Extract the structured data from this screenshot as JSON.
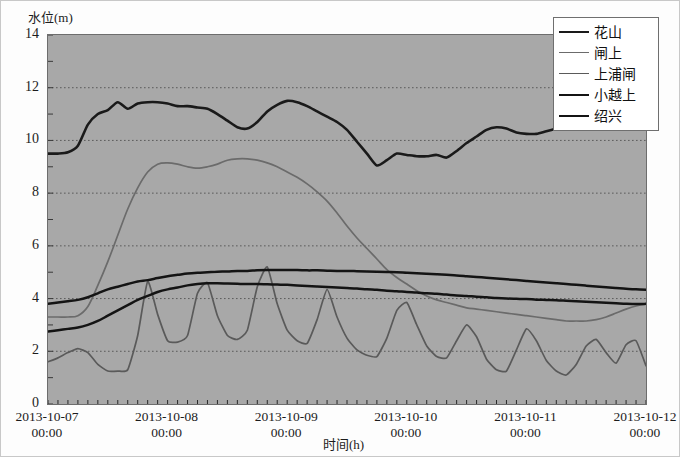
{
  "axes": {
    "y_title": "水位(m)",
    "x_title": "时间(h)",
    "y_ticks": [
      "14",
      "12",
      "10",
      "8",
      "6",
      "4",
      "2",
      "0"
    ],
    "x_ticks": [
      {
        "date": "2013-10-07",
        "time": "00:00"
      },
      {
        "date": "2013-10-08",
        "time": "00:00"
      },
      {
        "date": "2013-10-09",
        "time": "00:00"
      },
      {
        "date": "2013-10-10",
        "time": "00:00"
      },
      {
        "date": "2013-10-11",
        "time": "00:00"
      },
      {
        "date": "2013-10-12",
        "time": "00:00"
      }
    ]
  },
  "legend": {
    "items": [
      {
        "label": "花山",
        "color": "#1a1a1a",
        "width": "2.6px"
      },
      {
        "label": "闸上",
        "color": "#6b6b6b",
        "width": "1.8px"
      },
      {
        "label": "上浦闸",
        "color": "#5a5a5a",
        "width": "1.8px"
      },
      {
        "label": "小越上",
        "color": "#141414",
        "width": "2.6px"
      },
      {
        "label": "绍兴",
        "color": "#141414",
        "width": "2.6px"
      }
    ]
  },
  "style": {
    "plot_bg": "#a8a8a8",
    "grid_color": "#4e4e4e",
    "frame_color": "#6d6d6d",
    "text_color": "#1c1c1c"
  },
  "chart_data": {
    "type": "line",
    "title": "",
    "xlabel": "时间(h)",
    "ylabel": "水位(m)",
    "ylim": [
      0,
      14
    ],
    "xlim": [
      "2013-10-07 00:00",
      "2013-10-12 00:00"
    ],
    "grid": true,
    "legend_position": "top-right",
    "x_unit": "hours since 2013-10-07 00:00",
    "x": [
      0,
      2,
      4,
      6,
      8,
      10,
      12,
      14,
      16,
      18,
      20,
      22,
      24,
      26,
      28,
      30,
      32,
      34,
      36,
      38,
      40,
      42,
      44,
      46,
      48,
      50,
      52,
      54,
      56,
      58,
      60,
      62,
      64,
      66,
      68,
      70,
      72,
      74,
      76,
      78,
      80,
      82,
      84,
      86,
      88,
      90,
      92,
      94,
      96,
      98,
      100,
      102,
      104,
      106,
      108,
      110,
      112,
      114,
      116,
      118,
      120
    ],
    "series": [
      {
        "name": "花山",
        "color": "#1a1a1a",
        "values": [
          9.5,
          9.5,
          9.55,
          9.8,
          10.6,
          11.0,
          11.15,
          11.45,
          11.2,
          11.4,
          11.45,
          11.45,
          11.4,
          11.3,
          11.3,
          11.25,
          11.2,
          11.0,
          10.75,
          10.5,
          10.45,
          10.7,
          11.1,
          11.35,
          11.5,
          11.45,
          11.3,
          11.1,
          10.9,
          10.7,
          10.4,
          9.95,
          9.5,
          9.05,
          9.25,
          9.5,
          9.45,
          9.4,
          9.4,
          9.45,
          9.35,
          9.6,
          9.9,
          10.15,
          10.4,
          10.5,
          10.45,
          10.3,
          10.25,
          10.25,
          10.35,
          10.45,
          10.55,
          10.5,
          10.45,
          10.45,
          10.5,
          10.5,
          10.5,
          10.5,
          10.5
        ]
      },
      {
        "name": "闸上",
        "color": "#6b6b6b",
        "values": [
          3.3,
          3.3,
          3.3,
          3.35,
          3.7,
          4.5,
          5.4,
          6.4,
          7.4,
          8.2,
          8.8,
          9.1,
          9.15,
          9.1,
          9.0,
          8.95,
          9.0,
          9.1,
          9.25,
          9.3,
          9.3,
          9.25,
          9.15,
          9.0,
          8.8,
          8.6,
          8.35,
          8.05,
          7.7,
          7.25,
          6.75,
          6.3,
          5.9,
          5.5,
          5.1,
          4.8,
          4.55,
          4.3,
          4.1,
          3.95,
          3.85,
          3.75,
          3.65,
          3.6,
          3.55,
          3.5,
          3.45,
          3.4,
          3.35,
          3.3,
          3.25,
          3.2,
          3.15,
          3.15,
          3.15,
          3.2,
          3.3,
          3.45,
          3.6,
          3.72,
          3.8
        ]
      },
      {
        "name": "上浦闸",
        "color": "#5a5a5a",
        "values": [
          1.6,
          1.75,
          1.95,
          2.1,
          1.95,
          1.5,
          1.25,
          1.25,
          1.3,
          2.6,
          4.65,
          3.4,
          2.4,
          2.35,
          2.6,
          4.2,
          4.6,
          3.35,
          2.6,
          2.45,
          2.8,
          4.45,
          5.2,
          3.8,
          2.8,
          2.4,
          2.3,
          3.2,
          4.35,
          3.3,
          2.5,
          2.05,
          1.85,
          1.8,
          2.5,
          3.55,
          3.85,
          3.0,
          2.2,
          1.8,
          1.75,
          2.4,
          3.0,
          2.55,
          1.7,
          1.3,
          1.25,
          2.05,
          2.85,
          2.4,
          1.65,
          1.25,
          1.1,
          1.5,
          2.2,
          2.45,
          1.95,
          1.55,
          2.25,
          2.4,
          1.45
        ]
      },
      {
        "name": "小越上",
        "color": "#141414",
        "values": [
          3.8,
          3.85,
          3.9,
          3.95,
          4.05,
          4.2,
          4.35,
          4.45,
          4.55,
          4.65,
          4.7,
          4.78,
          4.85,
          4.9,
          4.95,
          4.98,
          5.0,
          5.02,
          5.03,
          5.05,
          5.05,
          5.07,
          5.08,
          5.08,
          5.08,
          5.08,
          5.07,
          5.07,
          5.06,
          5.05,
          5.05,
          5.04,
          5.03,
          5.02,
          5.01,
          5.0,
          4.98,
          4.96,
          4.94,
          4.92,
          4.9,
          4.88,
          4.85,
          4.82,
          4.79,
          4.76,
          4.73,
          4.7,
          4.67,
          4.64,
          4.61,
          4.58,
          4.55,
          4.52,
          4.49,
          4.46,
          4.43,
          4.4,
          4.37,
          4.35,
          4.33
        ]
      },
      {
        "name": "绍兴",
        "color": "#141414",
        "values": [
          2.75,
          2.8,
          2.85,
          2.9,
          3.0,
          3.15,
          3.35,
          3.55,
          3.75,
          3.95,
          4.1,
          4.25,
          4.35,
          4.42,
          4.5,
          4.55,
          4.58,
          4.58,
          4.57,
          4.56,
          4.55,
          4.55,
          4.54,
          4.53,
          4.52,
          4.5,
          4.48,
          4.46,
          4.44,
          4.42,
          4.4,
          4.38,
          4.35,
          4.33,
          4.3,
          4.28,
          4.25,
          4.23,
          4.2,
          4.18,
          4.15,
          4.12,
          4.1,
          4.07,
          4.05,
          4.02,
          4.0,
          3.99,
          3.98,
          3.96,
          3.95,
          3.94,
          3.92,
          3.9,
          3.88,
          3.86,
          3.84,
          3.82,
          3.8,
          3.79,
          3.8
        ]
      }
    ]
  }
}
